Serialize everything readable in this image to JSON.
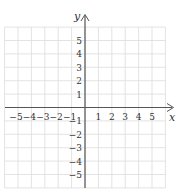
{
  "chart_data": {
    "type": "coordinate-grid",
    "title": "",
    "xlabel": "x",
    "ylabel": "y",
    "xlim": [
      -6,
      6
    ],
    "ylim": [
      -6,
      6
    ],
    "grid": true,
    "x_ticks": [
      "−5",
      "−4",
      "−3",
      "−2",
      "−1",
      "1",
      "2",
      "3",
      "4",
      "5"
    ],
    "y_ticks": [
      "5",
      "4",
      "3",
      "2",
      "1",
      "−1",
      "−2",
      "−3",
      "−4",
      "−5"
    ],
    "x_tick_values": [
      -5,
      -4,
      -3,
      -2,
      -1,
      1,
      2,
      3,
      4,
      5
    ],
    "y_tick_values": [
      5,
      4,
      3,
      2,
      1,
      -1,
      -2,
      -3,
      -4,
      -5
    ],
    "series": []
  },
  "axes": {
    "x_label": "x",
    "y_label": "y"
  },
  "colors": {
    "grid": "#dcdcdc",
    "axis": "#555555",
    "text": "#333333"
  }
}
